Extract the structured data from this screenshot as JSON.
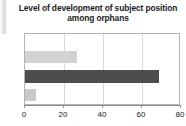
{
  "figure": {
    "background_color": "#ffffff",
    "artifact_name": "page-edge-artifact"
  },
  "chart_data": {
    "type": "bar",
    "orientation": "horizontal",
    "title": "Level of development of subject position among orphans",
    "title_line_1": "Level of development of subject position",
    "title_line_2": "among orphans",
    "xlabel": "",
    "ylabel": "",
    "categories": [
      "",
      "",
      ""
    ],
    "values": [
      26.7,
      68.7,
      5.6
    ],
    "bar_colors": [
      "#d2d2d2",
      "#4d4d4d",
      "#c9c9c9"
    ],
    "xlim": [
      0,
      80
    ],
    "xticks": [
      0,
      20,
      40,
      60,
      80
    ],
    "xtick_labels": [
      "0",
      "20",
      "40",
      "60",
      "80"
    ],
    "gridlines": [
      20,
      40,
      60
    ],
    "grid": true,
    "grid_color": "#d9d9d9",
    "legend": false,
    "frame_color": "#b4b4b4",
    "axis_color": "#8c8c8c"
  }
}
